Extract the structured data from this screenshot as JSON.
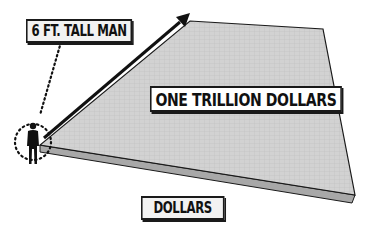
{
  "labels": {
    "man": "6 FT. TALL MAN",
    "slab": "ONE TRILLION DOLLARS",
    "legend": "DOLLARS"
  },
  "colors": {
    "slab_top": "#cfcfcf",
    "slab_side": "#a9a9a9",
    "outline": "#1a1a1a",
    "background": "#ffffff"
  },
  "icons": {
    "man": "person-silhouette-icon",
    "arrow": "arrow-up-right-icon"
  }
}
